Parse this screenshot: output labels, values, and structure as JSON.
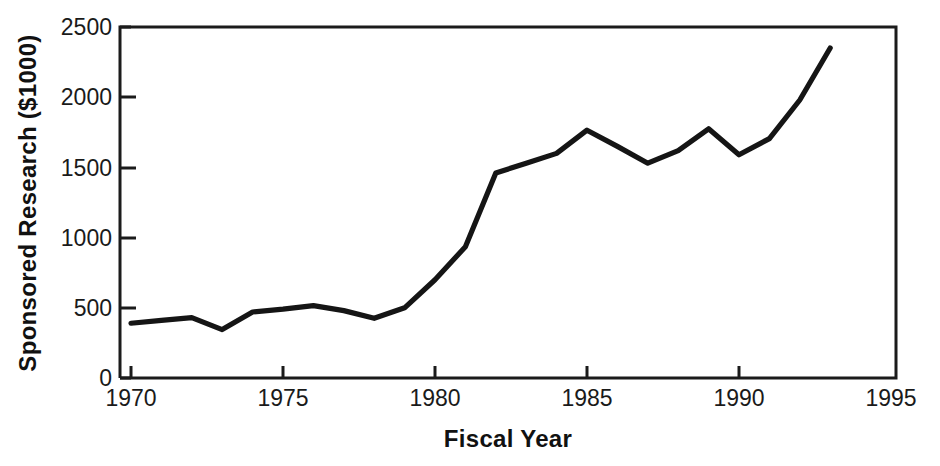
{
  "chart_data": {
    "type": "line",
    "title": "",
    "xlabel": "Fiscal Year",
    "ylabel": "Sponsored Research ($1000)",
    "xlim": [
      1970,
      1995
    ],
    "ylim": [
      0,
      2500
    ],
    "grid": false,
    "legend": null,
    "xticks": [
      1970,
      1975,
      1980,
      1985,
      1990,
      1995
    ],
    "xticklabels": [
      "1970",
      "1975",
      "1980",
      "1985",
      "1990",
      "1995"
    ],
    "yticks": [
      0,
      500,
      1000,
      1500,
      2000,
      2500
    ],
    "yticklabels": [
      "0",
      "500",
      "1000",
      "1500",
      "2000",
      "2500"
    ],
    "x": [
      1970,
      1971,
      1972,
      1973,
      1974,
      1975,
      1976,
      1977,
      1978,
      1979,
      1980,
      1981,
      1982,
      1983,
      1984,
      1985,
      1986,
      1987,
      1988,
      1989,
      1990,
      1991,
      1992,
      1993
    ],
    "values": [
      390,
      410,
      430,
      345,
      470,
      490,
      515,
      480,
      425,
      500,
      700,
      935,
      1460,
      1530,
      1600,
      1765,
      1650,
      1530,
      1620,
      1775,
      1590,
      1705,
      1980,
      2350
    ],
    "series": [
      {
        "name": "Sponsored Research",
        "color": "#151515",
        "values": [
          390,
          410,
          430,
          345,
          470,
          490,
          515,
          480,
          425,
          500,
          700,
          935,
          1460,
          1530,
          1600,
          1765,
          1650,
          1530,
          1620,
          1775,
          1590,
          1705,
          1980,
          2350
        ]
      }
    ]
  },
  "figure": {
    "background": "#ffffff",
    "axis_color": "#1b1b1b",
    "line_color": "#151515"
  }
}
